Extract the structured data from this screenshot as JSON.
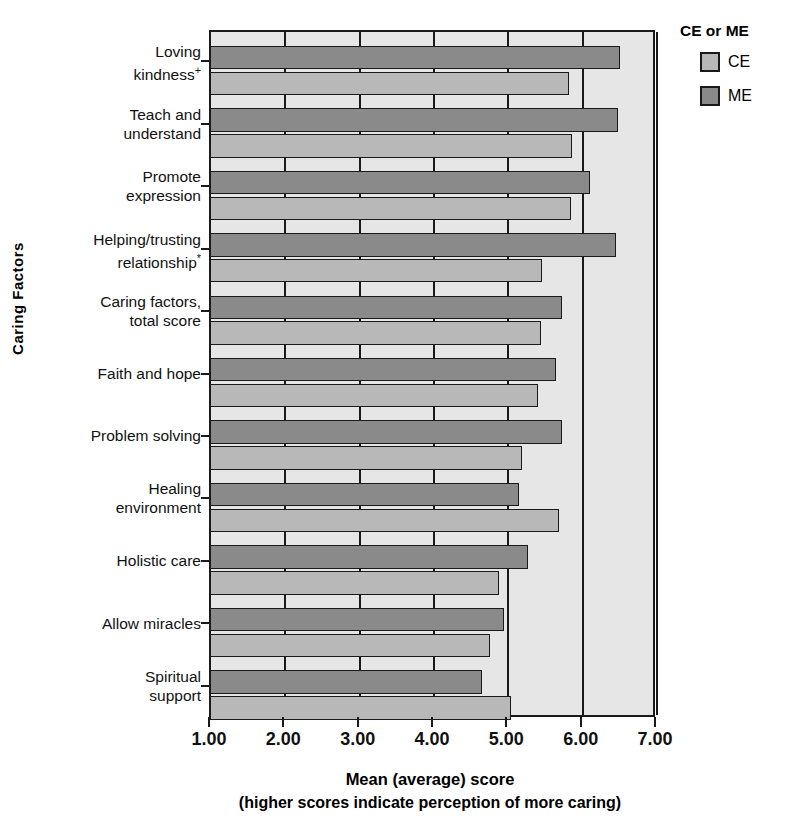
{
  "chart_data": {
    "type": "bar",
    "orientation": "horizontal",
    "title": "",
    "xlabel": "Mean (average) score",
    "xlabel_sub": "(higher scores indicate perception of more caring)",
    "ylabel": "Caring Factors",
    "xlim": [
      1.0,
      7.0
    ],
    "xticks": [
      "1.00",
      "2.00",
      "3.00",
      "4.00",
      "5.00",
      "6.00",
      "7.00"
    ],
    "xtick_values": [
      1.0,
      2.0,
      3.0,
      4.0,
      5.0,
      6.0,
      7.0
    ],
    "grid": true,
    "legend_position": "top-right",
    "categories": [
      "Loving kindness+",
      "Teach and understand",
      "Promote expression",
      "Helping/trusting relationship*",
      "Caring factors, total score",
      "Faith and hope",
      "Problem solving",
      "Healing environment",
      "Holistic care",
      "Allow miracles",
      "Spiritual support"
    ],
    "category_lines": [
      [
        "Loving",
        "kindness+"
      ],
      [
        "Teach and",
        "understand"
      ],
      [
        "Promote",
        "expression"
      ],
      [
        "Helping/trusting",
        "relationship*"
      ],
      [
        "Caring factors,",
        "total score"
      ],
      [
        "Faith and hope"
      ],
      [
        "Problem solving"
      ],
      [
        "Healing",
        "environment"
      ],
      [
        "Holistic care"
      ],
      [
        "Allow miracles"
      ],
      [
        "Spiritual",
        "support"
      ]
    ],
    "series": [
      {
        "name": "ME",
        "color": "#8a8a8a",
        "values": [
          6.5,
          6.48,
          6.1,
          6.45,
          5.72,
          5.64,
          5.72,
          5.15,
          5.26,
          4.94,
          4.64
        ]
      },
      {
        "name": "CE",
        "color": "#b8b8b8",
        "values": [
          5.82,
          5.86,
          5.84,
          5.45,
          5.44,
          5.4,
          5.19,
          5.68,
          4.88,
          4.76,
          5.04
        ]
      }
    ]
  },
  "legend": {
    "title": "CE or ME",
    "entries": [
      {
        "label": "CE",
        "color": "#b8b8b8"
      },
      {
        "label": "ME",
        "color": "#8a8a8a"
      }
    ]
  },
  "colors": {
    "plot_background": "#e6e6e6",
    "axis": "#1a1a1a",
    "ce": "#b8b8b8",
    "me": "#8a8a8a"
  },
  "footnotes": {
    "plus": "+",
    "asterisk": "*"
  }
}
